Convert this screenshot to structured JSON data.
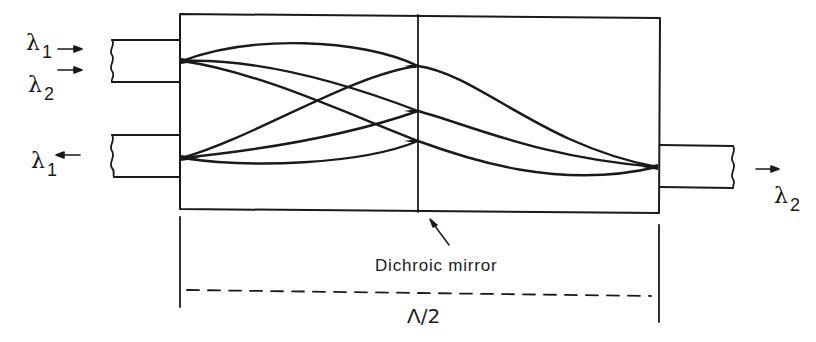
{
  "diagram": {
    "type": "wavelength-division multiplexer (GRIN-rod lens with dichroic mirror)",
    "colors": {
      "stroke": "#1a1a1a",
      "background": "#ffffff"
    },
    "labels": {
      "input_left_1": {
        "symbol": "λ",
        "subscript": "1",
        "arrow": "right"
      },
      "input_left_2": {
        "symbol": "λ",
        "subscript": "2",
        "arrow": "right"
      },
      "output_left": {
        "symbol": "λ",
        "subscript": "1",
        "arrow": "left"
      },
      "output_right": {
        "symbol": "λ",
        "subscript": "2",
        "arrow": "right"
      },
      "mirror_caption": "Dichroic mirror",
      "dimension": "Λ/2"
    },
    "components": [
      {
        "id": "lens-body",
        "kind": "rectangle",
        "label": ""
      },
      {
        "id": "dichroic-mirror",
        "kind": "vertical-line",
        "label": "Dichroic mirror"
      },
      {
        "id": "fiber-input",
        "kind": "fiber",
        "side": "left",
        "carries": [
          "λ1",
          "λ2"
        ]
      },
      {
        "id": "fiber-output-left",
        "kind": "fiber",
        "side": "left",
        "carries": [
          "λ1"
        ]
      },
      {
        "id": "fiber-output-right",
        "kind": "fiber",
        "side": "right",
        "carries": [
          "λ2"
        ]
      }
    ]
  }
}
